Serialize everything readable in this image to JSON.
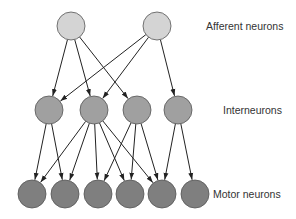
{
  "diagram": {
    "type": "neural-network",
    "colors": {
      "afferent": "#d4d4d4",
      "interneuron": "#a0a0a0",
      "motor": "#7f7f7f",
      "stroke": "#555555",
      "edge": "#222222"
    },
    "node_radius": 14,
    "layers": [
      {
        "id": "afferent",
        "label": "Afferent neurons",
        "label_pos": [
          206,
          30
        ],
        "nodes": [
          {
            "id": "A1",
            "x": 71,
            "y": 26
          },
          {
            "id": "A2",
            "x": 157,
            "y": 26
          }
        ]
      },
      {
        "id": "interneuron",
        "label": "Interneurons",
        "label_pos": [
          223,
          114
        ],
        "nodes": [
          {
            "id": "I1",
            "x": 49,
            "y": 110
          },
          {
            "id": "I2",
            "x": 94,
            "y": 110
          },
          {
            "id": "I3",
            "x": 137,
            "y": 110
          },
          {
            "id": "I4",
            "x": 178,
            "y": 110
          }
        ]
      },
      {
        "id": "motor",
        "label": "Motor neurons",
        "label_pos": [
          213,
          198
        ],
        "nodes": [
          {
            "id": "M1",
            "x": 32,
            "y": 194
          },
          {
            "id": "M2",
            "x": 65,
            "y": 194
          },
          {
            "id": "M3",
            "x": 98,
            "y": 194
          },
          {
            "id": "M4",
            "x": 130,
            "y": 194
          },
          {
            "id": "M5",
            "x": 162,
            "y": 194
          },
          {
            "id": "M6",
            "x": 195,
            "y": 194
          }
        ]
      }
    ],
    "edges": [
      [
        "A1",
        "I1"
      ],
      [
        "A1",
        "I2"
      ],
      [
        "A1",
        "I3"
      ],
      [
        "A2",
        "I1"
      ],
      [
        "A2",
        "I2"
      ],
      [
        "A2",
        "I4"
      ],
      [
        "I1",
        "M1"
      ],
      [
        "I1",
        "M2"
      ],
      [
        "I2",
        "M1"
      ],
      [
        "I2",
        "M2"
      ],
      [
        "I2",
        "M3"
      ],
      [
        "I2",
        "M4"
      ],
      [
        "I2",
        "M5"
      ],
      [
        "I3",
        "M3"
      ],
      [
        "I3",
        "M4"
      ],
      [
        "I3",
        "M5"
      ],
      [
        "I4",
        "M5"
      ],
      [
        "I4",
        "M6"
      ]
    ]
  }
}
